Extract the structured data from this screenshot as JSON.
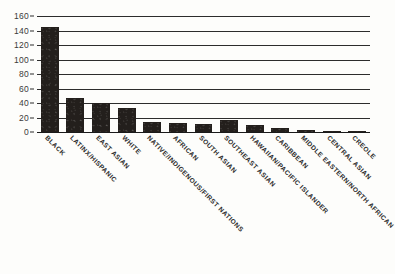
{
  "chart_data": {
    "type": "bar",
    "title": "",
    "subtitle": "",
    "xlabel": "",
    "ylabel": "",
    "ylim": [
      0,
      160
    ],
    "yticks": [
      0,
      20,
      40,
      60,
      80,
      100,
      120,
      140,
      160
    ],
    "ytick_labels": [
      "0",
      "20",
      "40",
      "60",
      "80",
      "100",
      "120",
      "140",
      "160"
    ],
    "grid": true,
    "legend": false,
    "orientation": "vertical",
    "bar_color": "#231f1c",
    "background_color": "#fdfdfb",
    "axis_color": "#2c2c2c",
    "categories": [
      "BLACK",
      "LATINX/HISPANIC",
      "EAST ASIAN",
      "WHITE",
      "NATIVE/INDIGENOUS/FIRST NATIONS",
      "AFRICAN",
      "SOUTH ASIAN",
      "SOUTHEAST ASIAN",
      "HAWAIIAN/PACIFIC ISLANDER",
      "CARIBBEAN",
      "MIDDLE EASTERN/NORTH AFRICAN",
      "CENTRAL ASIAN",
      "CREOLE"
    ],
    "values": [
      145,
      47,
      40,
      33,
      14,
      13,
      11,
      16,
      9,
      5,
      3,
      2,
      2
    ]
  }
}
